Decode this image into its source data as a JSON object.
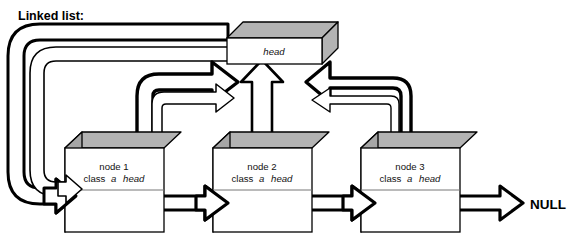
{
  "diagram": {
    "title": "Linked list:",
    "type": "linked-list-3d-box-diagram",
    "terminator_label": "NULL",
    "colors": {
      "outline": "#000000",
      "box_face": "#ffffff",
      "box_top_gray": "#b3b3b3",
      "box_side_gray": "#a6a6a6",
      "arrow_fill": "#ffffff",
      "background": "#ffffff"
    },
    "head": {
      "label": "head",
      "label_style": "italic"
    },
    "nodes": [
      {
        "name": "node 1",
        "class_text": "class a head",
        "class_prefix": "class",
        "class_name": "a",
        "member": "head"
      },
      {
        "name": "node 2",
        "class_text": "class a head",
        "class_prefix": "class",
        "class_name": "a",
        "member": "head"
      },
      {
        "name": "node 3",
        "class_text": "class a head",
        "class_prefix": "class",
        "class_name": "a",
        "member": "head"
      }
    ],
    "links": [
      {
        "from": "node 1",
        "to": "node 2",
        "kind": "next-pointer",
        "style": "hollow-right-arrow"
      },
      {
        "from": "node 2",
        "to": "node 3",
        "kind": "next-pointer",
        "style": "hollow-right-arrow"
      },
      {
        "from": "node 3",
        "to": "NULL",
        "kind": "next-pointer",
        "style": "hollow-right-arrow"
      },
      {
        "from": "node 1",
        "to": "head",
        "kind": "head-pointer",
        "style": "hollow-curved-arrow"
      },
      {
        "from": "node 2",
        "to": "head",
        "kind": "head-pointer",
        "style": "hollow-vertical-arrow"
      },
      {
        "from": "node 3",
        "to": "head",
        "kind": "head-pointer",
        "style": "hollow-curved-arrow"
      },
      {
        "from": "head",
        "to": "node 1",
        "kind": "head-reference",
        "style": "hollow-wraparound-arrow"
      },
      {
        "from": "head",
        "to": "node 1",
        "kind": "head-reference-outer",
        "style": "hollow-wraparound-arrow"
      }
    ]
  }
}
